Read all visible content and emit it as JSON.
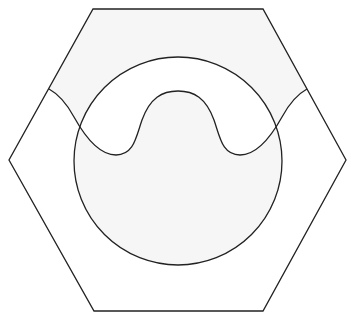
{
  "diagram": {
    "type": "geometric-figure",
    "colors": {
      "background": "#ffffff",
      "fill": "#f6f6f6",
      "stroke": "#222222"
    },
    "hexagon": {
      "points": [
        [
          93,
          9
        ],
        [
          263,
          9
        ],
        [
          346,
          160
        ],
        [
          263,
          311
        ],
        [
          94,
          311
        ],
        [
          9,
          160
        ]
      ]
    },
    "circle": {
      "cx": 178,
      "cy": 161,
      "r": 104
    },
    "wave": {
      "start": [
        49,
        89
      ],
      "end": [
        307,
        89
      ],
      "peak": [
        178,
        91
      ],
      "troughs": [
        [
          117,
          155
        ],
        [
          238,
          155
        ]
      ]
    }
  }
}
